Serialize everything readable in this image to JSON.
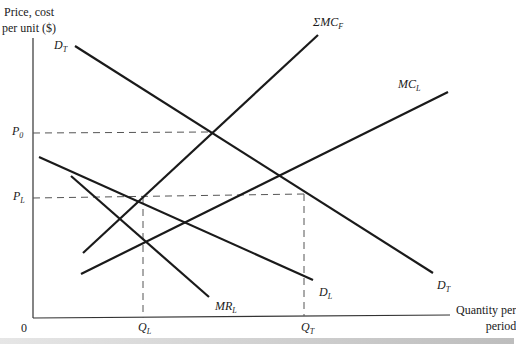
{
  "diagram": {
    "type": "economics supply-demand diagram",
    "axes": {
      "y_label_line1": "Price, cost",
      "y_label_line2": "per unit ($)",
      "x_label_line1": "Quantity per",
      "x_label_line2": "period",
      "origin": "0"
    },
    "price_levels": [
      {
        "id": "P0",
        "base": "P",
        "sub": "0"
      },
      {
        "id": "PL",
        "base": "P",
        "sub": "L"
      }
    ],
    "quantity_levels": [
      {
        "id": "QL",
        "base": "Q",
        "sub": "L"
      },
      {
        "id": "QT",
        "base": "Q",
        "sub": "T"
      }
    ],
    "curves": [
      {
        "id": "DT",
        "base": "D",
        "sub": "T",
        "description": "Total demand (two labels: start and end)"
      },
      {
        "id": "SMCF",
        "base": "ΣMC",
        "sub": "F",
        "description": "Sum of fringe firms' marginal cost"
      },
      {
        "id": "MCL",
        "base": "MC",
        "sub": "L",
        "description": "Leader's marginal cost"
      },
      {
        "id": "DL",
        "base": "D",
        "sub": "L",
        "description": "Leader's demand"
      },
      {
        "id": "MRL",
        "base": "MR",
        "sub": "L",
        "description": "Leader's marginal revenue"
      }
    ]
  },
  "colors": {
    "line": "#1a1a1a",
    "dashed": "#555555",
    "axis": "#333333",
    "background": "#ffffff"
  }
}
